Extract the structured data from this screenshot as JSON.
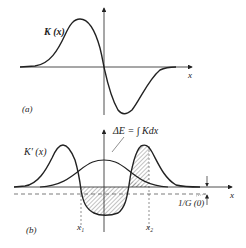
{
  "panel_a": {
    "tag": "(a)",
    "curve_label": "K (x)",
    "axis_label": "x"
  },
  "panel_b": {
    "tag": "(b)",
    "curve_label": "K′ (x)",
    "axis_label": "x",
    "annotation": "ΔE = ∫ Kdx",
    "offset_label": "1/G (0)",
    "x1_label": "x₁",
    "x2_label": "x₂"
  },
  "colors": {
    "line": "#222222",
    "hatch": "#555555",
    "background": "#ffffff"
  }
}
